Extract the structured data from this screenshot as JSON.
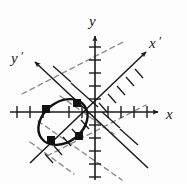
{
  "figure": {
    "background_color": "#fdfdfd",
    "ink_color": "#1a1a1a",
    "dashed_color": "#8a8a8a",
    "labels": {
      "x_axis": "x",
      "y_axis": "y",
      "x_prime_axis": "x",
      "y_prime_axis": "y",
      "prime_symbol": "′"
    },
    "origin": {
      "x": 95,
      "y": 112
    },
    "axes": [
      {
        "name": "x-axis",
        "angle_deg": 0,
        "from": {
          "x": 10,
          "y": 112
        },
        "to": {
          "x": 160,
          "y": 112
        },
        "arrow": "end",
        "tick_count_positive": 5,
        "tick_count_negative": 4,
        "tick_spacing": 13
      },
      {
        "name": "y-axis",
        "angle_deg": 90,
        "from": {
          "x": 95,
          "y": 178
        },
        "to": {
          "x": 95,
          "y": 34
        },
        "arrow": "end",
        "tick_count_positive": 5,
        "tick_count_negative": 5,
        "tick_spacing": 13
      },
      {
        "name": "x-prime-axis",
        "angle_deg": 38,
        "from": {
          "x": 33,
          "y": 161
        },
        "to": {
          "x": 148,
          "y": 51
        },
        "arrow": "end",
        "tick_count_positive": 6,
        "tick_count_negative": 5,
        "tick_spacing": 13
      },
      {
        "name": "y-prime-axis",
        "angle_deg": 128,
        "from": {
          "x": 148,
          "y": 167
        },
        "to": {
          "x": 33,
          "y": 61
        },
        "arrow": "end",
        "tick_count_positive": 6,
        "tick_count_negative": 6,
        "tick_spacing": 13
      }
    ],
    "dashed_lines": [
      {
        "name": "dashed-parallel-upper",
        "from": {
          "x": 22,
          "y": 94
        },
        "to": {
          "x": 125,
          "y": 41
        }
      },
      {
        "name": "dashed-parallel-lower",
        "from": {
          "x": 47,
          "y": 156
        },
        "to": {
          "x": 146,
          "y": 105
        }
      },
      {
        "name": "dashed-cross-a",
        "from": {
          "x": 40,
          "y": 122
        },
        "to": {
          "x": 120,
          "y": 178
        }
      },
      {
        "name": "dashed-cross-b",
        "from": {
          "x": 62,
          "y": 97
        },
        "to": {
          "x": 112,
          "y": 132
        }
      }
    ],
    "conic": {
      "name": "ellipse",
      "type": "ellipse",
      "center": {
        "x": 63,
        "y": 123
      },
      "semi_major": 26,
      "semi_minor": 20,
      "rotation_deg": 38,
      "stroke_width": 2.2
    },
    "markers": [
      {
        "name": "vertex-left",
        "x": 46,
        "y": 109,
        "size": 7.5
      },
      {
        "name": "vertex-top-right",
        "x": 77,
        "y": 103,
        "size": 7.5
      },
      {
        "name": "vertex-bottom-left",
        "x": 51,
        "y": 140,
        "size": 7.5
      },
      {
        "name": "vertex-bottom-right",
        "x": 79,
        "y": 136,
        "size": 7.5
      }
    ],
    "label_positions": {
      "x": {
        "x": 168,
        "y": 118
      },
      "y": {
        "x": 94,
        "y": 22
      },
      "x_prime": {
        "x": 150,
        "y": 46
      },
      "y_prime": {
        "x": 16,
        "y": 62
      }
    }
  }
}
